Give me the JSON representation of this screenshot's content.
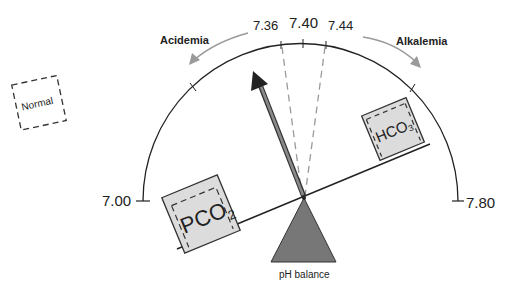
{
  "diagram": {
    "title": "pH balance",
    "scale": {
      "min_label": "7.00",
      "max_label": "7.80",
      "normal_low": "7.36",
      "normal_mid": "7.40",
      "normal_high": "7.44"
    },
    "regions": {
      "left": "Acidemia",
      "right": "Alkalemia"
    },
    "legend_box": "Normal",
    "weights": {
      "left": {
        "main": "PCO",
        "sub": "2"
      },
      "right": {
        "main": "HCO",
        "sub": "3"
      }
    },
    "fulcrum_label": "pH balance",
    "colors": {
      "line": "#222222",
      "pointer": "#777777",
      "fulcrum": "#777777",
      "box_fill": "#dcdcdc",
      "arrow": "#9a9a9a",
      "dashed": "#9a9a9a"
    }
  }
}
